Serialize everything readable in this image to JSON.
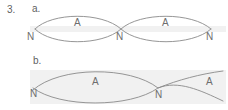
{
  "figure": {
    "question_number": "3.",
    "parts": [
      {
        "key": "a",
        "label": "a.",
        "description": "standing wave with two loops",
        "loops": 2,
        "nodes": [
          {
            "label": "N",
            "x": 35,
            "y": 29
          },
          {
            "label": "N",
            "x": 121,
            "y": 29
          },
          {
            "label": "N",
            "x": 211,
            "y": 29
          }
        ],
        "antinodes": [
          {
            "label": "A",
            "x": 78,
            "y": 22
          },
          {
            "label": "A",
            "x": 166,
            "y": 22
          }
        ]
      },
      {
        "key": "b",
        "label": "b.",
        "description": "standing wave with one and a half loops",
        "loops": 1.5,
        "nodes": [
          {
            "label": "N",
            "x": 36,
            "y": 88
          },
          {
            "label": "N",
            "x": 158,
            "y": 88
          }
        ],
        "antinodes": [
          {
            "label": "A",
            "x": 96,
            "y": 81
          },
          {
            "label": "A",
            "x": 210,
            "y": 81
          }
        ]
      }
    ],
    "colors": {
      "stroke": "#8a8a8a",
      "text": "#6b6b6b",
      "band": "#f1f1f1",
      "background": "#ffffff"
    }
  }
}
